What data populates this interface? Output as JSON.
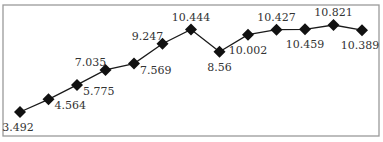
{
  "chart_data": {
    "type": "line",
    "title": "",
    "xlabel": "",
    "ylabel": "",
    "x": [
      1,
      2,
      3,
      4,
      5,
      6,
      7,
      8,
      9,
      10,
      11,
      12,
      13
    ],
    "series": [
      {
        "name": "series-1",
        "values": [
          3.492,
          4.564,
          5.775,
          7.035,
          7.569,
          9.247,
          10.444,
          8.56,
          10.002,
          10.427,
          10.459,
          10.821,
          10.389
        ],
        "labels": [
          "3.492",
          "4.564",
          "5.775",
          "7.035",
          "7.569",
          "9.247",
          "10.444",
          "8.56",
          "10.002",
          "10.427",
          "10.459",
          "10.821",
          "10.389"
        ],
        "label_positions": [
          "below",
          "right",
          "right",
          "above",
          "right",
          "above",
          "above",
          "below",
          "below",
          "above",
          "below",
          "above",
          "below"
        ]
      }
    ],
    "marker": "diamond",
    "grid": false,
    "axes_visible": false,
    "legend": "none",
    "colors": {
      "line": "#1a1a1a",
      "marker": "#111111",
      "frame": "#9a9a9a",
      "label": "#333333"
    }
  }
}
